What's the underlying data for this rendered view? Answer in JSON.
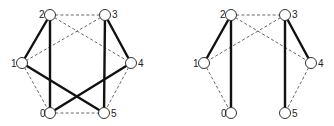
{
  "graphs": [
    {
      "id": "left",
      "nodes": [
        {
          "id": "0",
          "label": "0",
          "x": 50,
          "y": 113,
          "lx": 40,
          "ly": 117
        },
        {
          "id": "1",
          "label": "1",
          "x": 22,
          "y": 63,
          "lx": 11,
          "ly": 67
        },
        {
          "id": "2",
          "label": "2",
          "x": 50,
          "y": 15,
          "lx": 39,
          "ly": 18
        },
        {
          "id": "3",
          "label": "3",
          "x": 105,
          "y": 15,
          "lx": 112,
          "ly": 18
        },
        {
          "id": "4",
          "label": "4",
          "x": 131,
          "y": 63,
          "lx": 138,
          "ly": 67
        },
        {
          "id": "5",
          "label": "5",
          "x": 104,
          "y": 113,
          "lx": 111,
          "ly": 117
        }
      ],
      "solid_edges": [
        [
          "2",
          "1"
        ],
        [
          "2",
          "0"
        ],
        [
          "3",
          "5"
        ],
        [
          "3",
          "4"
        ],
        [
          "1",
          "5"
        ],
        [
          "4",
          "0"
        ]
      ],
      "dashed_edges": [
        [
          "2",
          "3"
        ],
        [
          "2",
          "4"
        ],
        [
          "3",
          "1"
        ],
        [
          "1",
          "0"
        ],
        [
          "4",
          "5"
        ],
        [
          "0",
          "5"
        ]
      ]
    },
    {
      "id": "right",
      "nodes": [
        {
          "id": "0",
          "label": "0",
          "x": 231,
          "y": 113,
          "lx": 221,
          "ly": 117
        },
        {
          "id": "1",
          "label": "1",
          "x": 204,
          "y": 63,
          "lx": 193,
          "ly": 67
        },
        {
          "id": "2",
          "label": "2",
          "x": 231,
          "y": 15,
          "lx": 220,
          "ly": 18
        },
        {
          "id": "3",
          "label": "3",
          "x": 285,
          "y": 15,
          "lx": 292,
          "ly": 18
        },
        {
          "id": "4",
          "label": "4",
          "x": 311,
          "y": 63,
          "lx": 318,
          "ly": 67
        },
        {
          "id": "5",
          "label": "5",
          "x": 285,
          "y": 113,
          "lx": 292,
          "ly": 117
        }
      ],
      "solid_edges": [
        [
          "2",
          "1"
        ],
        [
          "2",
          "0"
        ],
        [
          "3",
          "5"
        ],
        [
          "3",
          "4"
        ]
      ],
      "dashed_edges": [
        [
          "2",
          "3"
        ],
        [
          "2",
          "4"
        ],
        [
          "3",
          "1"
        ],
        [
          "1",
          "0"
        ],
        [
          "4",
          "5"
        ]
      ]
    }
  ],
  "node_radius": 5.5
}
